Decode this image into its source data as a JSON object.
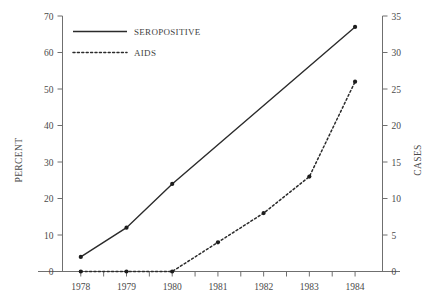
{
  "chart_data": {
    "type": "line",
    "title": "",
    "xlabel": "",
    "ylabel": "PERCENT",
    "y2label": "CASES",
    "categories": [
      "1978",
      "1979",
      "1980",
      "1981",
      "1982",
      "1983",
      "1984"
    ],
    "x": [
      1978,
      1979,
      1980,
      1981,
      1982,
      1983,
      1984
    ],
    "xlim": [
      1977.6,
      1984.6
    ],
    "ylim": [
      0,
      70
    ],
    "y2lim": [
      0,
      35
    ],
    "yticks": [
      0,
      10,
      20,
      30,
      40,
      50,
      60,
      70
    ],
    "y2ticks": [
      0,
      5,
      10,
      15,
      20,
      25,
      30,
      35
    ],
    "grid": false,
    "legend_position": "top-left",
    "series": [
      {
        "name": "SEROPOSITIVE",
        "axis": "left",
        "style": "solid",
        "unit": "percent",
        "values": [
          4,
          12,
          24,
          35,
          46,
          57,
          67
        ],
        "points": [
          {
            "x": 1978,
            "y": 4
          },
          {
            "x": 1979,
            "y": 12
          },
          {
            "x": 1980,
            "y": 24
          },
          {
            "x": 1984,
            "y": 67
          }
        ],
        "markers_at": [
          1978,
          1979,
          1980,
          1984
        ]
      },
      {
        "name": "AIDS",
        "axis": "right",
        "style": "dotted",
        "unit": "cases",
        "values": [
          0,
          0,
          0,
          4,
          8,
          13,
          26
        ],
        "points": [
          {
            "x": 1978,
            "y": 0
          },
          {
            "x": 1979,
            "y": 0
          },
          {
            "x": 1980,
            "y": 0
          },
          {
            "x": 1981,
            "y": 4
          },
          {
            "x": 1982,
            "y": 8
          },
          {
            "x": 1983,
            "y": 13
          },
          {
            "x": 1984,
            "y": 26
          }
        ],
        "markers_at": [
          1978,
          1979,
          1980,
          1981,
          1982,
          1983,
          1984
        ]
      }
    ]
  },
  "axes": {
    "left_title": "PERCENT",
    "right_title": "CASES",
    "left_ticks": [
      "70",
      "60",
      "50",
      "40",
      "30",
      "20",
      "10",
      "0"
    ],
    "right_ticks": [
      "35",
      "30",
      "25",
      "20",
      "15",
      "10",
      "5",
      "0"
    ],
    "x_ticks": [
      "1978",
      "1979",
      "1980",
      "1981",
      "1982",
      "1983",
      "1984"
    ]
  },
  "legend": {
    "items": [
      {
        "label": "SEROPOSITIVE",
        "style": "solid"
      },
      {
        "label": "AIDS",
        "style": "dotted"
      }
    ]
  },
  "colors": {
    "line": "#2b2b2b",
    "axis": "#6f6f6f",
    "text": "#4a4a4a",
    "background": "#ffffff"
  }
}
